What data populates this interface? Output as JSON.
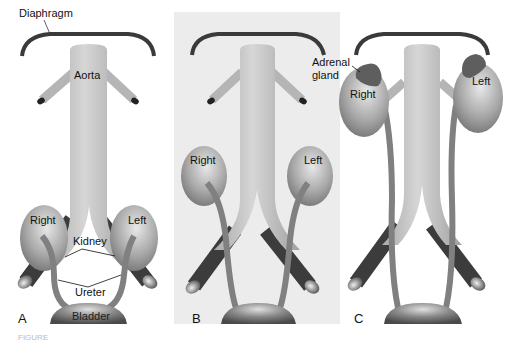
{
  "figure": {
    "panels": [
      {
        "letter": "A",
        "kidney_right_label": "Right",
        "kidney_left_label": "Left",
        "background": "#ffffff"
      },
      {
        "letter": "B",
        "kidney_right_label": "Right",
        "kidney_left_label": "Left",
        "background": "#ececec"
      },
      {
        "letter": "C",
        "kidney_right_label": "Right",
        "kidney_left_label": "Left",
        "background": "#ffffff"
      }
    ],
    "labels": {
      "diaphragm": "Diaphragm",
      "aorta": "Aorta",
      "kidney": "Kidney",
      "ureter": "Ureter",
      "bladder": "Bladder",
      "adrenal_line1": "Adrenal",
      "adrenal_line2": "gland"
    },
    "caption_partial": "FIGURE",
    "colors": {
      "diaphragm": "#3a3a3a",
      "aorta": "#bdbdbd",
      "kidney": "#9a9a9a",
      "ureter": "#8a8a8a",
      "iliac_vessel": "#3c3c3c",
      "adrenal": "#6a6a6a",
      "bladder": "#6e6e6e",
      "panel_b_bg": "#ececec"
    }
  }
}
